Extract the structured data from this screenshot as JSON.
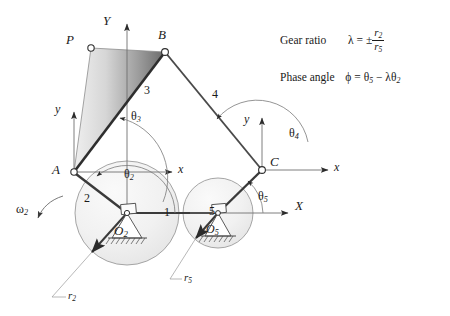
{
  "figure": {
    "background": "#ffffff",
    "width": 450,
    "height": 316
  },
  "axes": {
    "global_y_label": "Y",
    "global_x_label": "X",
    "local_y_at_A_label": "y",
    "local_x_at_A_label": "x",
    "local_y_at_C_label": "y",
    "local_x_at_C_label": "x"
  },
  "points": {
    "P": "P",
    "B": "B",
    "A": "A",
    "C": "C",
    "O2": "O",
    "O2_sub": "2",
    "O5": "O",
    "O5_sub": "5"
  },
  "links": {
    "link1": "1",
    "link2": "2",
    "link3": "3",
    "link4": "4",
    "link5": "5"
  },
  "angles": {
    "theta2": "θ",
    "theta2_sub": "2",
    "theta3": "θ",
    "theta3_sub": "3",
    "theta4": "θ",
    "theta4_sub": "4",
    "theta5": "θ",
    "theta5_sub": "5"
  },
  "radii": {
    "r2": "r",
    "r2_sub": "2",
    "r5": "r",
    "r5_sub": "5"
  },
  "omega": {
    "symbol": "ω",
    "sub": "2"
  },
  "formulas": {
    "gear_ratio_label": "Gear ratio",
    "gear_ratio_lambda": "λ",
    "gear_ratio_eq": "=",
    "gear_ratio_pm": "±",
    "gear_ratio_numerator": "r",
    "gear_ratio_numerator_sub": "2",
    "gear_ratio_denominator": "r",
    "gear_ratio_denominator_sub": "5",
    "phase_angle_label": "Phase angle",
    "phase_angle_phi": "ϕ",
    "phase_angle_eq": "=",
    "phase_angle_theta5": "θ",
    "phase_angle_theta5_sub": "5",
    "phase_angle_minus": "−",
    "phase_angle_lambda": "λ",
    "phase_angle_theta2": "θ",
    "phase_angle_theta2_sub": "2"
  },
  "colors": {
    "line": "#4d4d4d",
    "link_dark": "#333333",
    "text": "#1a1a1a",
    "gear_fill_light": "#f2f2f2",
    "gear_fill_shade": "#e0e0e0",
    "coupler_dark": "#6e6e6e",
    "coupler_light": "#ededed",
    "thin": "#8a8a8a"
  },
  "geometry": {
    "A": [
      74,
      172
    ],
    "B": [
      165,
      52
    ],
    "P": [
      91,
      48
    ],
    "C": [
      262,
      170
    ],
    "O2": [
      127,
      213
    ],
    "O5": [
      218,
      213
    ],
    "gear2_radius": 52,
    "gear5_radius": 35
  }
}
